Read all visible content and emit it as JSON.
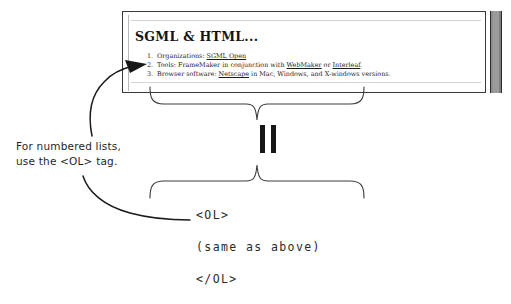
{
  "document": {
    "heading": "SGML & HTML...",
    "scrollbar": "vertical-scrollbar",
    "list": [
      {
        "number": "1.",
        "pre": "Organizations: ",
        "link1": "SGML Open",
        "mid": "",
        "link2": "",
        "post": ""
      },
      {
        "number": "2.",
        "pre": "Tools: FrameMaker in conjunction with ",
        "link1": "WebMaker",
        "mid": " or ",
        "link2": "Interleaf",
        "post": "."
      },
      {
        "number": "3.",
        "pre": "Browser software: ",
        "link1": "Netscape",
        "mid": " in Mac, Windows, and X-windows versions.",
        "link2": "",
        "post": ""
      }
    ]
  },
  "equivalence": {
    "symbol": "||",
    "meaning": "equals"
  },
  "annotation": {
    "line1": "For numbered lists,",
    "line2": "use the <OL> tag."
  },
  "code": {
    "open_tag": "<OL>",
    "body": "(same as above)",
    "close_tag": "</OL>"
  },
  "colors": {
    "ink": "#171717",
    "document_border": "#3a3a3a",
    "rule": "#d2d2d2",
    "scrollbar": "#9b9b9b"
  }
}
